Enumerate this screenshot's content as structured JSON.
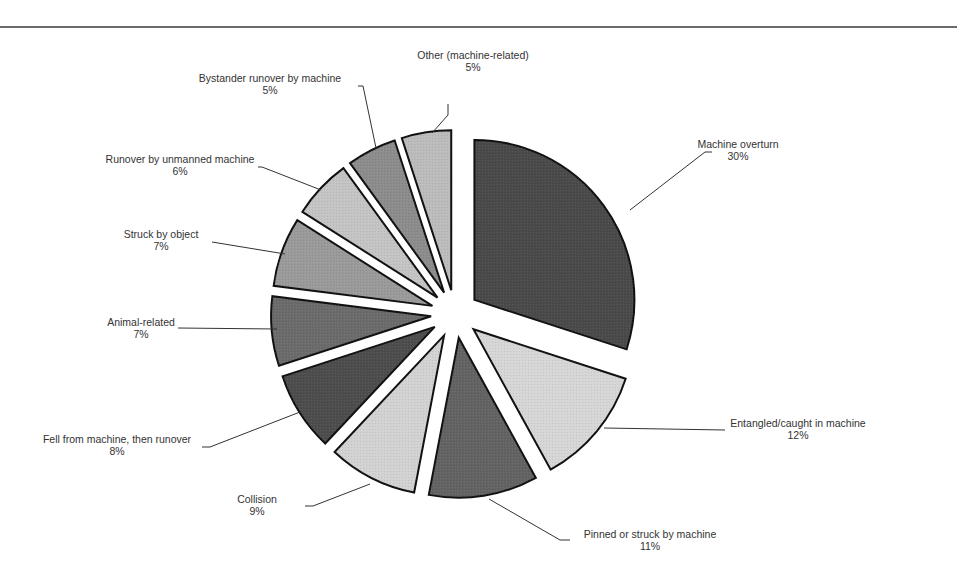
{
  "chart_data": {
    "type": "pie",
    "title": "",
    "exploded": true,
    "start_angle_deg": -90,
    "direction": "clockwise",
    "slices": [
      {
        "label": "Machine overturn",
        "value": 30,
        "pct": "30%",
        "color": "#4a4a4a",
        "label_x": 738,
        "label_y": 148,
        "anchor": "middle",
        "leader": [
          [
            630,
            210
          ],
          [
            705,
            152
          ],
          [
            712,
            152
          ]
        ]
      },
      {
        "label": "Entangled/caught in machine",
        "value": 12,
        "pct": "12%",
        "color": "#d6d6d6",
        "label_x": 798,
        "label_y": 427,
        "anchor": "middle",
        "leader": [
          [
            604,
            428
          ],
          [
            725,
            430
          ]
        ]
      },
      {
        "label": "Pinned or struck by machine",
        "value": 11,
        "pct": "11%",
        "color": "#636363",
        "label_x": 650,
        "label_y": 538,
        "anchor": "middle",
        "leader": [
          [
            489,
            499
          ],
          [
            560,
            540
          ],
          [
            570,
            540
          ]
        ]
      },
      {
        "label": "Collision",
        "value": 9,
        "pct": "9%",
        "color": "#d2d2d2",
        "label_x": 257,
        "label_y": 503,
        "anchor": "middle",
        "leader": [
          [
            370,
            484
          ],
          [
            313,
            506
          ],
          [
            305,
            506
          ]
        ]
      },
      {
        "label": "Fell from machine, then runover",
        "value": 8,
        "pct": "8%",
        "color": "#4d4d4d",
        "label_x": 117,
        "label_y": 443,
        "anchor": "middle",
        "leader": [
          [
            300,
            412
          ],
          [
            210,
            447
          ],
          [
            202,
            447
          ]
        ]
      },
      {
        "label": "Animal-related",
        "value": 7,
        "pct": "7%",
        "color": "#6b6b6b",
        "label_x": 141,
        "label_y": 326,
        "anchor": "middle",
        "leader": [
          [
            277,
            329
          ],
          [
            178,
            328
          ]
        ]
      },
      {
        "label": "Struck by object",
        "value": 7,
        "pct": "7%",
        "color": "#9a9a9a",
        "label_x": 161,
        "label_y": 238,
        "anchor": "middle",
        "leader": [
          [
            285,
            254
          ],
          [
            212,
            242
          ]
        ]
      },
      {
        "label": "Runover by unmanned machine",
        "value": 6,
        "pct": "6%",
        "color": "#c4c4c4",
        "label_x": 180,
        "label_y": 163,
        "anchor": "middle",
        "leader": [
          [
            321,
            190
          ],
          [
            262,
            167
          ],
          [
            258,
            167
          ]
        ]
      },
      {
        "label": "Bystander runover by machine",
        "value": 5,
        "pct": "5%",
        "color": "#8c8c8c",
        "label_x": 270,
        "label_y": 82,
        "anchor": "middle",
        "leader": [
          [
            376,
            148
          ],
          [
            363,
            86
          ],
          [
            358,
            86
          ]
        ]
      },
      {
        "label": "Other (machine-related)",
        "value": 5,
        "pct": "5%",
        "color": "#bcbcbc",
        "label_x": 473,
        "label_y": 59,
        "anchor": "middle",
        "leader": [
          [
            432,
            133
          ],
          [
            448,
            115
          ],
          [
            448,
            104
          ]
        ]
      }
    ],
    "legend": null
  },
  "layout": {
    "center_x": 455,
    "center_y": 314,
    "radius": 160,
    "explode": 24,
    "stroke": "#111111"
  }
}
